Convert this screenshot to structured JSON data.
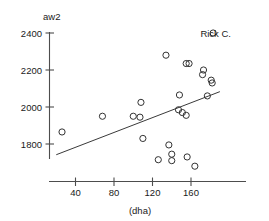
{
  "chart_data": {
    "type": "scatter",
    "title": "",
    "subtitle": "",
    "xlabel": "(dha)",
    "ylabel": "aw2",
    "xlim": [
      20,
      190
    ],
    "ylim": [
      1670,
      2430
    ],
    "grid": false,
    "legend": "none",
    "x_ticks": [
      40,
      80,
      120,
      160
    ],
    "x_tick_labels": [
      "40",
      "80",
      "120",
      "160"
    ],
    "y_ticks": [
      1800,
      2000,
      2200,
      2400
    ],
    "y_tick_labels": [
      "1800",
      "2000",
      "2200",
      "2400"
    ],
    "marker_style": "open-circle",
    "points": [
      {
        "x": 26,
        "y": 1865
      },
      {
        "x": 68,
        "y": 1950
      },
      {
        "x": 100,
        "y": 1950
      },
      {
        "x": 107,
        "y": 1945
      },
      {
        "x": 108,
        "y": 2025
      },
      {
        "x": 110,
        "y": 1830
      },
      {
        "x": 134,
        "y": 2280
      },
      {
        "x": 126,
        "y": 1715
      },
      {
        "x": 137,
        "y": 1795
      },
      {
        "x": 140,
        "y": 1745
      },
      {
        "x": 140,
        "y": 1710
      },
      {
        "x": 148,
        "y": 2065
      },
      {
        "x": 147,
        "y": 1985
      },
      {
        "x": 151,
        "y": 1970
      },
      {
        "x": 155,
        "y": 1955
      },
      {
        "x": 156,
        "y": 1730
      },
      {
        "x": 155,
        "y": 2235
      },
      {
        "x": 158,
        "y": 2235
      },
      {
        "x": 164,
        "y": 1680
      },
      {
        "x": 173,
        "y": 2200
      },
      {
        "x": 172,
        "y": 2175
      },
      {
        "x": 177,
        "y": 2060
      },
      {
        "x": 181,
        "y": 2145
      },
      {
        "x": 182,
        "y": 2130
      },
      {
        "x": 183,
        "y": 2400
      }
    ],
    "annotations": [
      {
        "text": "Rick C.",
        "x": 183,
        "y": 2400,
        "points_to": "top-right-point"
      }
    ],
    "trend_line": {
      "type": "linear-fit",
      "x_start": 20,
      "y_start": 1742,
      "x_end": 190,
      "y_end": 2083
    }
  }
}
